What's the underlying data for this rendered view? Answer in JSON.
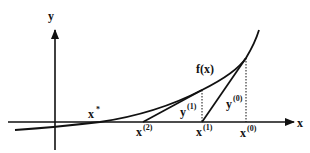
{
  "diagram": {
    "type": "newton-method-illustration",
    "axes": {
      "x_label": "x",
      "y_label": "y"
    },
    "curve": {
      "label": "f(x)"
    },
    "points": {
      "root": {
        "base": "x",
        "sup": "*"
      },
      "x2": {
        "base": "x",
        "sup": "(2)"
      },
      "x1": {
        "base": "x",
        "sup": "(1)"
      },
      "x0": {
        "base": "x",
        "sup": "(0)"
      }
    },
    "heights": {
      "y1": {
        "base": "y",
        "sup": "(1)"
      },
      "y0": {
        "base": "y",
        "sup": "(0)"
      }
    },
    "colors": {
      "line": "#111111",
      "background": "#ffffff"
    }
  }
}
